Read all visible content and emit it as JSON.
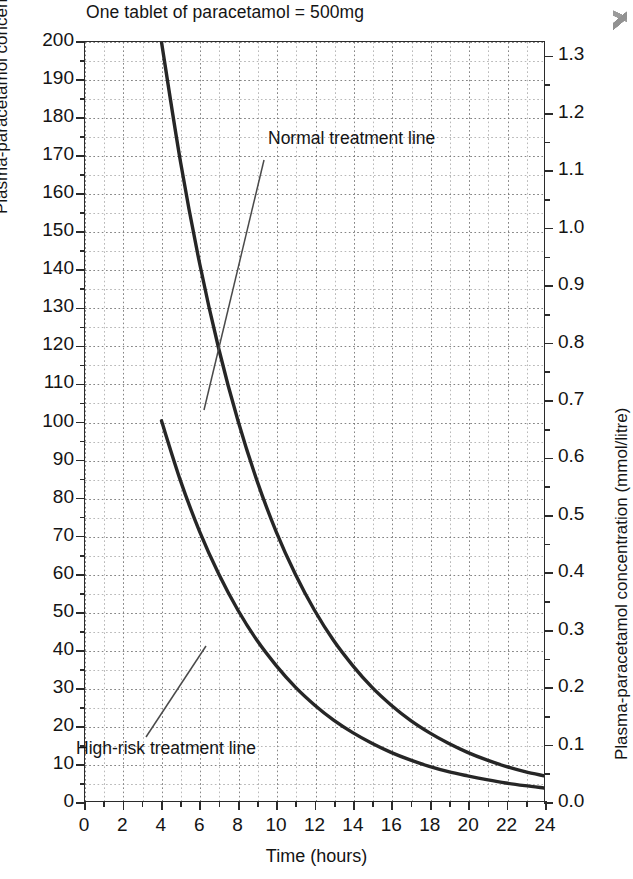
{
  "chart_data": {
    "type": "line",
    "title": "One tablet of paracetamol = 500mg",
    "xlabel": "Time (hours)",
    "ylabel": "Plasma-paracetamol concentration (mg/litre)",
    "ylabel_right": "Plasma-paracetamol concentration (mmol/litre)",
    "xlim": [
      0,
      24
    ],
    "ylim": [
      0,
      200
    ],
    "ylim_right": [
      0.0,
      1.325
    ],
    "grid": true,
    "legend_position": "none",
    "xticks": [
      0,
      2,
      4,
      6,
      8,
      10,
      12,
      14,
      16,
      18,
      20,
      22,
      24
    ],
    "xtick_labels": [
      "0",
      "2",
      "4",
      "6",
      "8",
      "10",
      "12",
      "14",
      "16",
      "18",
      "20",
      "22",
      "24"
    ],
    "xtick_minor_step": 1,
    "yticks_left": [
      0,
      10,
      20,
      30,
      40,
      50,
      60,
      70,
      80,
      90,
      100,
      110,
      120,
      130,
      140,
      150,
      160,
      170,
      180,
      190,
      200
    ],
    "ytick_labels_left": [
      "0",
      "10",
      "20",
      "30",
      "40",
      "50",
      "60",
      "70",
      "80",
      "90",
      "100",
      "110",
      "120",
      "130",
      "140",
      "150",
      "160",
      "170",
      "180",
      "190",
      "200"
    ],
    "yticks_right": [
      0.0,
      0.1,
      0.2,
      0.3,
      0.4,
      0.5,
      0.6,
      0.7,
      0.8,
      0.9,
      1.0,
      1.1,
      1.2,
      1.3
    ],
    "ytick_labels_right": [
      "0.0",
      "0.1",
      "0.2",
      "0.3",
      "0.4",
      "0.5",
      "0.6",
      "0.7",
      "0.8",
      "0.9",
      "1.0",
      "1.1",
      "1.2",
      "1.3"
    ],
    "series": [
      {
        "name": "Normal treatment line",
        "color": "#262626",
        "x": [
          4,
          5,
          6,
          7,
          8,
          9,
          10,
          11,
          12,
          13,
          14,
          15,
          16,
          17,
          18,
          19,
          20,
          21,
          22,
          23,
          24
        ],
        "values": [
          200,
          168.2,
          141.4,
          118.9,
          100,
          84.1,
          70.7,
          59.5,
          50,
          42.0,
          35.4,
          29.7,
          25,
          21.0,
          17.7,
          14.9,
          12.5,
          10.5,
          8.8,
          7.4,
          6.3
        ]
      },
      {
        "name": "High-risk treatment line",
        "color": "#262626",
        "x": [
          4,
          5,
          6,
          7,
          8,
          9,
          10,
          11,
          12,
          13,
          14,
          15,
          16,
          17,
          18,
          19,
          20,
          21,
          22,
          23,
          24
        ],
        "values": [
          100,
          84.1,
          70.7,
          59.5,
          50,
          42.0,
          35.4,
          29.7,
          25,
          21.0,
          17.7,
          14.9,
          12.5,
          10.5,
          8.8,
          7.4,
          6.3,
          5.3,
          4.4,
          3.7,
          3.1
        ]
      }
    ],
    "annotations": [
      {
        "text": "Normal treatment line",
        "points_to_series": "Normal treatment line"
      },
      {
        "text": "High-risk treatment line",
        "points_to_series": "High-risk treatment line"
      }
    ]
  }
}
